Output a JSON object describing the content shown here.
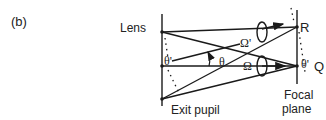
{
  "figure": {
    "panel_label": "(b)",
    "labels": {
      "lens": "Lens",
      "exit_pupil": "Exit pupil",
      "focal_plane_line1": "Focal",
      "focal_plane_line2": "plane",
      "point_R": "R",
      "point_Q": "Q",
      "omega_prime": "Ω'",
      "omega": "Ω",
      "theta": "θ",
      "theta_prime_left": "θ'",
      "theta_prime_right": "θ'"
    },
    "colors": {
      "line": "#1a1a1a",
      "background": "#ffffff"
    }
  }
}
